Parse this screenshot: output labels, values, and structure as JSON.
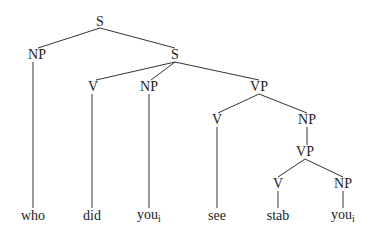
{
  "tree": {
    "nodes": [
      {
        "id": "s1",
        "label": "S",
        "x": 100,
        "y": 22
      },
      {
        "id": "np1",
        "label": "NP",
        "x": 37,
        "y": 55
      },
      {
        "id": "s2",
        "label": "S",
        "x": 175,
        "y": 55
      },
      {
        "id": "v1",
        "label": "V",
        "x": 93,
        "y": 87
      },
      {
        "id": "np2",
        "label": "NP",
        "x": 149,
        "y": 87
      },
      {
        "id": "vp1",
        "label": "VP",
        "x": 259,
        "y": 87
      },
      {
        "id": "v2",
        "label": "V",
        "x": 217,
        "y": 120
      },
      {
        "id": "np3",
        "label": "NP",
        "x": 307,
        "y": 120
      },
      {
        "id": "vp2",
        "label": "VP",
        "x": 305,
        "y": 152
      },
      {
        "id": "v3",
        "label": "V",
        "x": 278,
        "y": 184
      },
      {
        "id": "np4",
        "label": "NP",
        "x": 343,
        "y": 184
      }
    ],
    "leaves": [
      {
        "id": "w1",
        "word": "who",
        "sub": "",
        "x": 33,
        "y": 216
      },
      {
        "id": "w2",
        "word": "did",
        "sub": "",
        "x": 92,
        "y": 216
      },
      {
        "id": "w3",
        "word": "you",
        "sub": "i",
        "x": 149,
        "y": 216
      },
      {
        "id": "w4",
        "word": "see",
        "sub": "",
        "x": 217,
        "y": 216
      },
      {
        "id": "w5",
        "word": "stab",
        "sub": "",
        "x": 278,
        "y": 216
      },
      {
        "id": "w6",
        "word": "you",
        "sub": "i",
        "x": 343,
        "y": 216
      }
    ],
    "edges": [
      [
        100,
        28,
        38,
        48
      ],
      [
        100,
        28,
        175,
        48
      ],
      [
        33,
        62,
        33,
        208
      ],
      [
        175,
        62,
        96,
        80
      ],
      [
        175,
        62,
        151,
        80
      ],
      [
        175,
        62,
        259,
        80
      ],
      [
        92,
        94,
        92,
        208
      ],
      [
        149,
        94,
        149,
        208
      ],
      [
        259,
        94,
        218,
        113
      ],
      [
        259,
        94,
        307,
        113
      ],
      [
        217,
        127,
        217,
        208
      ],
      [
        307,
        127,
        307,
        145
      ],
      [
        305,
        159,
        278,
        177
      ],
      [
        305,
        159,
        343,
        177
      ],
      [
        278,
        191,
        278,
        208
      ],
      [
        343,
        191,
        343,
        208
      ]
    ]
  }
}
